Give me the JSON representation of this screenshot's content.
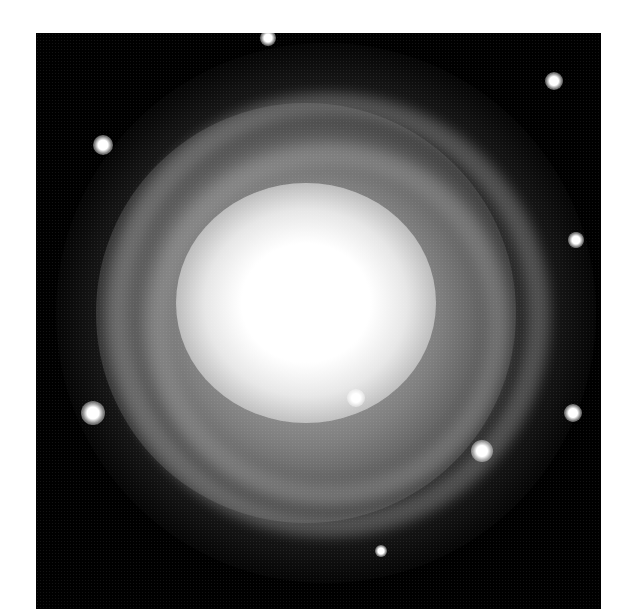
{
  "image": {
    "subject": "spiral galaxy",
    "colors": {
      "background": "#ffffff",
      "sky": "#000000",
      "core": "#ffffff"
    },
    "stars": [
      {
        "x": 67,
        "y": 112,
        "r": 10
      },
      {
        "x": 57,
        "y": 380,
        "r": 12
      },
      {
        "x": 446,
        "y": 418,
        "r": 11
      },
      {
        "x": 518,
        "y": 48,
        "r": 9
      },
      {
        "x": 540,
        "y": 207,
        "r": 8
      },
      {
        "x": 537,
        "y": 380,
        "r": 9
      },
      {
        "x": 345,
        "y": 518,
        "r": 6
      },
      {
        "x": 232,
        "y": 5,
        "r": 8
      },
      {
        "x": 320,
        "y": 365,
        "r": 9
      }
    ]
  }
}
